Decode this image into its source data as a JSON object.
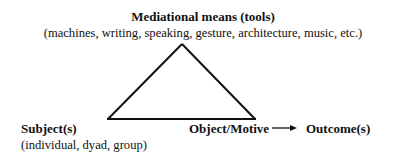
{
  "diagram": {
    "type": "mediated-action-triangle",
    "top_node": {
      "title": "Mediational means (tools)",
      "subtitle": "(machines, writing, speaking, gesture, architecture, music, etc.)"
    },
    "left_node": {
      "title": "Subject(s)",
      "subtitle": "(individual, dyad, group)"
    },
    "right_node": {
      "title": "Object/Motive"
    },
    "outcome_node": {
      "title": "Outcome(s)"
    },
    "edges": [
      {
        "from": "top_node",
        "to": "left_node",
        "style": "line"
      },
      {
        "from": "top_node",
        "to": "right_node",
        "style": "line"
      },
      {
        "from": "left_node",
        "to": "right_node",
        "style": "line"
      },
      {
        "from": "right_node",
        "to": "outcome_node",
        "style": "arrow"
      }
    ],
    "colors": {
      "line": "#111111",
      "text": "#111111",
      "background": "#ffffff"
    }
  }
}
